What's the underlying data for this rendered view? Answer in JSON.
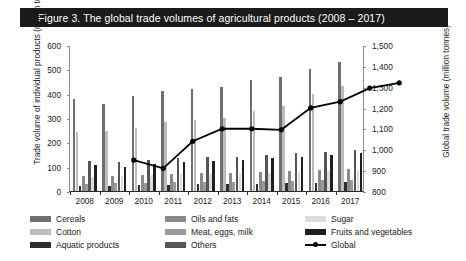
{
  "title": "Figure 3.  The global trade volumes of agricultural products (2008 – 2017)",
  "chart_data": {
    "type": "bar",
    "title": "Figure 3.  The global trade volumes of agricultural products (2008 – 2017)",
    "xlabel": "",
    "ylabel": "Trade volume of individual products (million tonnes)",
    "y2label": "Global trade volume (million tonnes)",
    "ylim": [
      0,
      600
    ],
    "y2lim": [
      800,
      1500
    ],
    "ytick_labels": [
      "0",
      "100",
      "200",
      "300",
      "400",
      "500",
      "600"
    ],
    "y2tick_labels": [
      "800",
      "900",
      "1,000",
      "1,100",
      "1,200",
      "1,300",
      "1,400",
      "1,500"
    ],
    "grid": false,
    "legend_position": "bottom",
    "categories": [
      "2008",
      "2009",
      "2010",
      "2011",
      "2012",
      "2013",
      "2014",
      "2015",
      "2016",
      "2017"
    ],
    "series": [
      {
        "name": "Cereals",
        "color": "#6e6e6e",
        "axis": "left",
        "values": [
          378,
          356,
          390,
          410,
          420,
          428,
          455,
          470,
          500,
          530
        ]
      },
      {
        "name": "Cotton",
        "color": "#bcbcbc",
        "axis": "left",
        "values": [
          243,
          245,
          258,
          283,
          290,
          300,
          330,
          350,
          400,
          430
        ]
      },
      {
        "name": "Aquatic products",
        "color": "#2e2e2e",
        "axis": "left",
        "values": [
          22,
          20,
          24,
          26,
          27,
          28,
          30,
          31,
          33,
          35
        ]
      },
      {
        "name": "Oils and fats",
        "color": "#8a8a8a",
        "axis": "left",
        "values": [
          60,
          62,
          66,
          70,
          72,
          76,
          80,
          84,
          88,
          92
        ]
      },
      {
        "name": "Meat, eggs, milk",
        "color": "#9a9a9a",
        "axis": "left",
        "values": [
          30,
          31,
          33,
          35,
          37,
          38,
          40,
          42,
          44,
          46
        ]
      },
      {
        "name": "Others",
        "color": "#555555",
        "axis": "left",
        "values": [
          125,
          118,
          128,
          135,
          138,
          140,
          150,
          155,
          162,
          168
        ]
      },
      {
        "name": "Sugar",
        "color": "#dcdcdc",
        "axis": "left",
        "values": [
          58,
          60,
          64,
          68,
          70,
          72,
          76,
          78,
          82,
          86
        ]
      },
      {
        "name": "Fruits and vegetables",
        "color": "#1f1f1f",
        "axis": "left",
        "values": [
          105,
          100,
          110,
          118,
          122,
          126,
          134,
          140,
          150,
          158
        ]
      }
    ],
    "line_series": {
      "name": "Global",
      "color": "#000000",
      "axis": "right",
      "marker": "circle",
      "values": [
        1030,
        990,
        1120,
        1180,
        1180,
        1175,
        1280,
        1310,
        1375,
        1400
      ]
    }
  },
  "legend": [
    {
      "label": "Cereals",
      "swatch": "#6e6e6e",
      "type": "bar"
    },
    {
      "label": "Oils and fats",
      "swatch": "#8a8a8a",
      "type": "bar"
    },
    {
      "label": "Sugar",
      "swatch": "#dcdcdc",
      "type": "bar"
    },
    {
      "label": "Cotton",
      "swatch": "#bcbcbc",
      "type": "bar"
    },
    {
      "label": "Meat, eggs, milk",
      "swatch": "#9a9a9a",
      "type": "bar"
    },
    {
      "label": "Fruits and vegetables",
      "swatch": "#1f1f1f",
      "type": "bar"
    },
    {
      "label": "Aquatic products",
      "swatch": "#2e2e2e",
      "type": "bar"
    },
    {
      "label": "Others",
      "swatch": "#555555",
      "type": "bar"
    },
    {
      "label": "Global",
      "swatch": "#000000",
      "type": "line"
    }
  ]
}
